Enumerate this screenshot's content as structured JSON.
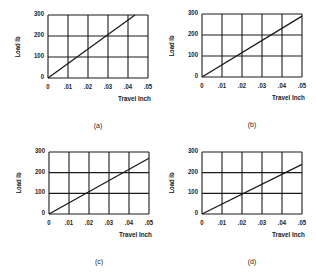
{
  "chart_data": [
    {
      "id": "a",
      "type": "line",
      "caption": "(a)",
      "xlabel": "Travel Inch",
      "ylabel": "Load lb",
      "xticks": [
        "0",
        ".01",
        ".02",
        ".03",
        ".04",
        ".05"
      ],
      "yticks": [
        "0",
        "100",
        "200",
        "300"
      ],
      "xlim": [
        0,
        0.05
      ],
      "ylim": [
        0,
        300
      ],
      "grid": true,
      "series": [
        {
          "name": "load-travel",
          "x": [
            0,
            0.0435
          ],
          "y": [
            0,
            300
          ]
        }
      ]
    },
    {
      "id": "b",
      "type": "line",
      "caption": "(b)",
      "xlabel": "Travel Inch",
      "ylabel": "Load lb",
      "xticks": [
        "0",
        ".01",
        ".02",
        ".03",
        ".04",
        ".05"
      ],
      "yticks": [
        "0",
        "100",
        "200",
        "300"
      ],
      "xlim": [
        0,
        0.05
      ],
      "ylim": [
        0,
        300
      ],
      "grid": true,
      "series": [
        {
          "name": "load-travel",
          "x": [
            0,
            0.05
          ],
          "y": [
            0,
            290
          ]
        }
      ]
    },
    {
      "id": "c",
      "type": "line",
      "caption": "(c)",
      "xlabel": "Travel Inch",
      "ylabel": "Load lb",
      "xticks": [
        "0",
        ".01",
        ".02",
        ".03",
        ".04",
        ".05"
      ],
      "yticks": [
        "0",
        "100",
        "200",
        "300"
      ],
      "xlim": [
        0,
        0.05
      ],
      "ylim": [
        0,
        300
      ],
      "grid": true,
      "series": [
        {
          "name": "load-travel",
          "x": [
            0,
            0.05
          ],
          "y": [
            0,
            270
          ]
        }
      ]
    },
    {
      "id": "d",
      "type": "line",
      "caption": "(d)",
      "xlabel": "Travel Inch",
      "ylabel": "Load lb",
      "xticks": [
        "0",
        ".01",
        ".02",
        ".03",
        ".04",
        ".05"
      ],
      "yticks": [
        "0",
        "100",
        "200",
        "300"
      ],
      "xlim": [
        0,
        0.05
      ],
      "ylim": [
        0,
        300
      ],
      "grid": true,
      "series": [
        {
          "name": "load-travel",
          "x": [
            0,
            0.05
          ],
          "y": [
            0,
            240
          ]
        }
      ]
    }
  ],
  "layout": {
    "panels": [
      {
        "left": 0,
        "top": 0,
        "plot": {
          "x": 48,
          "y": 15,
          "w": 100,
          "h": 63
        }
      },
      {
        "left": 158,
        "top": 0,
        "plot": {
          "x": 44,
          "y": 14,
          "w": 100,
          "h": 63
        }
      },
      {
        "left": 0,
        "top": 137,
        "plot": {
          "x": 49,
          "y": 15,
          "w": 100,
          "h": 62
        }
      },
      {
        "left": 158,
        "top": 137,
        "plot": {
          "x": 44,
          "y": 15,
          "w": 100,
          "h": 62
        }
      }
    ],
    "line_color": "#1a1a1a",
    "grid_color": "#1a1a1a"
  }
}
